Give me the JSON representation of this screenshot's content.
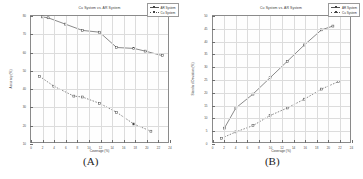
{
  "figure": {
    "panels": [
      {
        "caption": "(A)",
        "title": "Cu System vs. AR System",
        "xlabel": "Coverage (%)",
        "ylabel": "Accuracy (%)",
        "legend": [
          {
            "label": "AR System",
            "style": "solid"
          },
          {
            "label": "Cu System",
            "style": "dashed"
          }
        ]
      },
      {
        "caption": "(B)",
        "title": "Cu System vs. AR System",
        "xlabel": "Coverage (%)",
        "ylabel": "Standard Deviation (%)",
        "legend": [
          {
            "label": "AR System",
            "style": "solid"
          },
          {
            "label": "Cu System",
            "style": "dashed"
          }
        ]
      }
    ]
  },
  "chart_data": [
    {
      "type": "line",
      "title": "Cu System vs. AR System",
      "xlabel": "Coverage (%)",
      "ylabel": "Accuracy (%)",
      "xlim": [
        0,
        24
      ],
      "ylim": [
        10,
        80
      ],
      "xticks": [
        0,
        2,
        4,
        6,
        8,
        10,
        12,
        14,
        16,
        18,
        20,
        22,
        24
      ],
      "xtick_labels": [
        "0",
        "2",
        "4",
        "6",
        "8",
        "10",
        "12",
        "14",
        "16",
        "18",
        "20",
        "22",
        "24"
      ],
      "yticks": [
        10,
        20,
        30,
        40,
        50,
        60,
        70,
        80
      ],
      "ytick_labels": [
        "10",
        "20",
        "30",
        "40",
        "50",
        "60",
        "70",
        "80"
      ],
      "grid": true,
      "legend_position": "top-right",
      "series": [
        {
          "name": "AR System",
          "style": "solid",
          "marker": "square",
          "x": [
            2,
            3,
            6,
            9,
            12,
            15,
            18,
            20,
            23
          ],
          "y": [
            79.5,
            79.0,
            75.5,
            72.0,
            71.0,
            62.5,
            62.0,
            60.5,
            58.0
          ]
        },
        {
          "name": "Cu System",
          "style": "dashed",
          "marker": "square",
          "x": [
            1.5,
            4,
            7.5,
            9,
            12,
            15,
            18,
            21
          ],
          "y": [
            46.5,
            41.0,
            35.5,
            35.0,
            31.5,
            26.5,
            20.0,
            16.0
          ]
        }
      ]
    },
    {
      "type": "line",
      "title": "Cu System vs. AR System",
      "xlabel": "Coverage (%)",
      "ylabel": "Standard Deviation (%)",
      "xlim": [
        0,
        24
      ],
      "ylim": [
        0,
        50
      ],
      "xticks": [
        0,
        2,
        4,
        6,
        8,
        10,
        12,
        14,
        16,
        18,
        20,
        22,
        24
      ],
      "xtick_labels": [
        "0",
        "2",
        "4",
        "6",
        "8",
        "10",
        "12",
        "14",
        "16",
        "18",
        "20",
        "22",
        "24"
      ],
      "yticks": [
        0,
        5,
        10,
        15,
        20,
        25,
        30,
        35,
        40,
        45,
        50
      ],
      "ytick_labels": [
        "0",
        "5",
        "10",
        "15",
        "20",
        "25",
        "30",
        "35",
        "40",
        "45",
        "50"
      ],
      "grid": true,
      "legend_position": "top-right",
      "series": [
        {
          "name": "AR System",
          "style": "solid",
          "marker": "square",
          "x": [
            2,
            4,
            7,
            10,
            13,
            16,
            19,
            21
          ],
          "y": [
            5.5,
            13.5,
            19.0,
            25.5,
            32.0,
            38.5,
            44.5,
            46.0
          ]
        },
        {
          "name": "Cu System",
          "style": "dashed",
          "marker": "square",
          "x": [
            1.5,
            4,
            7,
            10,
            13,
            16,
            19,
            22
          ],
          "y": [
            1.5,
            4.0,
            6.5,
            10.5,
            13.5,
            17.0,
            21.0,
            24.0
          ]
        }
      ]
    }
  ]
}
